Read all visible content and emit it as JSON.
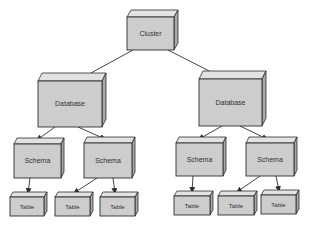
{
  "diagram": {
    "type": "hierarchy",
    "colors": {
      "background": "#ffffff",
      "face_front": "#cdcdcd",
      "face_top": "#e2e2e2",
      "face_side": "#a9a9a9",
      "stroke": "#2f2f2f",
      "text": "#333333",
      "edge": "#2f2f2f"
    },
    "nodes": [
      {
        "id": "cluster",
        "label": "Cluster",
        "level": 0,
        "x": 127,
        "y": 17,
        "w": 47,
        "h": 33,
        "d": 7,
        "font": 7
      },
      {
        "id": "db1",
        "label": "Database",
        "level": 1,
        "x": 38,
        "y": 81,
        "w": 64,
        "h": 46,
        "d": 8,
        "font": 7
      },
      {
        "id": "db2",
        "label": "Database",
        "level": 1,
        "x": 199,
        "y": 79,
        "w": 63,
        "h": 47,
        "d": 8,
        "font": 7
      },
      {
        "id": "schema1",
        "label": "Schema",
        "level": 2,
        "x": 14,
        "y": 144,
        "w": 47,
        "h": 34,
        "d": 6,
        "font": 7
      },
      {
        "id": "schema2",
        "label": "Schema",
        "level": 2,
        "x": 84,
        "y": 143,
        "w": 48,
        "h": 35,
        "d": 6,
        "font": 7
      },
      {
        "id": "schema3",
        "label": "Schema",
        "level": 2,
        "x": 176,
        "y": 143,
        "w": 47,
        "h": 33,
        "d": 6,
        "font": 7
      },
      {
        "id": "schema4",
        "label": "Schema",
        "level": 2,
        "x": 246,
        "y": 143,
        "w": 48,
        "h": 33,
        "d": 6,
        "font": 7
      },
      {
        "id": "table1",
        "label": "Table",
        "level": 3,
        "x": 10,
        "y": 197,
        "w": 34,
        "h": 19,
        "d": 5,
        "font": 6
      },
      {
        "id": "table2",
        "label": "Table",
        "level": 3,
        "x": 55,
        "y": 197,
        "w": 35,
        "h": 19,
        "d": 5,
        "font": 6
      },
      {
        "id": "table3",
        "label": "Table",
        "level": 3,
        "x": 100,
        "y": 197,
        "w": 35,
        "h": 19,
        "d": 5,
        "font": 6
      },
      {
        "id": "table4",
        "label": "Table",
        "level": 3,
        "x": 174,
        "y": 196,
        "w": 36,
        "h": 19,
        "d": 5,
        "font": 6
      },
      {
        "id": "table5",
        "label": "Table",
        "level": 3,
        "x": 218,
        "y": 196,
        "w": 36,
        "h": 19,
        "d": 5,
        "font": 6
      },
      {
        "id": "table6",
        "label": "Table",
        "level": 3,
        "x": 261,
        "y": 195,
        "w": 35,
        "h": 19,
        "d": 5,
        "font": 6
      }
    ],
    "edges": [
      {
        "from": "cluster",
        "to": "db1",
        "x1": 133,
        "y1": 50,
        "x2": 80,
        "y2": 79
      },
      {
        "from": "cluster",
        "to": "db2",
        "x1": 168,
        "y1": 50,
        "x2": 221,
        "y2": 77
      },
      {
        "from": "db1",
        "to": "schema1",
        "x1": 55,
        "y1": 127,
        "x2": 37,
        "y2": 140
      },
      {
        "from": "db1",
        "to": "schema2",
        "x1": 78,
        "y1": 127,
        "x2": 105,
        "y2": 139
      },
      {
        "from": "db2",
        "to": "schema3",
        "x1": 222,
        "y1": 126,
        "x2": 199,
        "y2": 139
      },
      {
        "from": "db2",
        "to": "schema4",
        "x1": 240,
        "y1": 126,
        "x2": 267,
        "y2": 139
      },
      {
        "from": "schema1",
        "to": "table1",
        "x1": 30,
        "y1": 178,
        "x2": 28,
        "y2": 193
      },
      {
        "from": "schema2",
        "to": "table2",
        "x1": 97,
        "y1": 178,
        "x2": 74,
        "y2": 193
      },
      {
        "from": "schema2",
        "to": "table3",
        "x1": 113,
        "y1": 178,
        "x2": 115,
        "y2": 193
      },
      {
        "from": "schema3",
        "to": "table4",
        "x1": 193,
        "y1": 176,
        "x2": 192,
        "y2": 192
      },
      {
        "from": "schema4",
        "to": "table5",
        "x1": 260,
        "y1": 176,
        "x2": 237,
        "y2": 192
      },
      {
        "from": "schema4",
        "to": "table6",
        "x1": 276,
        "y1": 176,
        "x2": 279,
        "y2": 191
      }
    ]
  }
}
